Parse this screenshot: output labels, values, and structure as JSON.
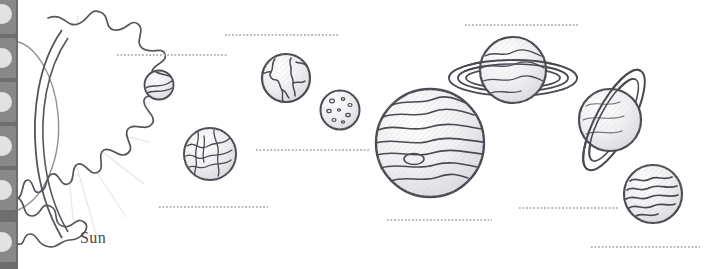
{
  "page": {
    "background_color": "#ffffff",
    "ink_color": "#4a4a52",
    "shade_color": "#d8d8dc",
    "dot_line_color": "#b9b9b9"
  },
  "sidebar": {
    "background_color": "#6e6e6e",
    "name": "thumbnail-rail",
    "thumbnails": [
      {
        "label": "thumbnail-1"
      },
      {
        "label": "thumbnail-2"
      },
      {
        "label": "thumbnail-3"
      },
      {
        "label": "thumbnail-4"
      },
      {
        "label": "thumbnail-5"
      },
      {
        "label": "thumbnail-6"
      }
    ]
  },
  "labels": {
    "sun": "Sun"
  },
  "bodies": [
    {
      "name": "sun",
      "label": "Sun",
      "type": "star",
      "x": 8,
      "y": 10,
      "size": 150,
      "has_rings": false
    },
    {
      "name": "mercury",
      "label": "",
      "type": "planet",
      "x": 142,
      "y": 68,
      "size": 30,
      "has_rings": false
    },
    {
      "name": "venus",
      "label": "",
      "type": "planet",
      "x": 180,
      "y": 124,
      "size": 56,
      "has_rings": false
    },
    {
      "name": "earth",
      "label": "",
      "type": "planet",
      "x": 242,
      "y": 52,
      "size": 52,
      "has_rings": false
    },
    {
      "name": "mars",
      "label": "",
      "type": "planet",
      "x": 300,
      "y": 88,
      "size": 44,
      "has_rings": false
    },
    {
      "name": "jupiter",
      "label": "",
      "type": "planet",
      "x": 372,
      "y": 88,
      "size": 110,
      "has_rings": false
    },
    {
      "name": "saturn",
      "label": "",
      "type": "ringed",
      "x": 444,
      "y": 32,
      "size": 122,
      "has_rings": true
    },
    {
      "name": "uranus",
      "label": "",
      "type": "ringed",
      "x": 552,
      "y": 62,
      "size": 118,
      "has_rings": true
    },
    {
      "name": "neptune",
      "label": "",
      "type": "planet",
      "x": 622,
      "y": 162,
      "size": 62,
      "has_rings": false
    }
  ],
  "answer_lines": [
    {
      "name": "answer-line-mercury",
      "x": 116,
      "y": 54,
      "width": 112
    },
    {
      "name": "answer-line-earth",
      "x": 224,
      "y": 34,
      "width": 114
    },
    {
      "name": "answer-line-venus",
      "x": 158,
      "y": 206,
      "width": 110
    },
    {
      "name": "answer-line-mars",
      "x": 255,
      "y": 149,
      "width": 114
    },
    {
      "name": "answer-line-saturn",
      "x": 464,
      "y": 24,
      "width": 114
    },
    {
      "name": "answer-line-jupiter",
      "x": 386,
      "y": 219,
      "width": 106
    },
    {
      "name": "answer-line-uranus",
      "x": 518,
      "y": 207,
      "width": 100
    },
    {
      "name": "answer-line-neptune",
      "x": 590,
      "y": 246,
      "width": 110
    }
  ]
}
